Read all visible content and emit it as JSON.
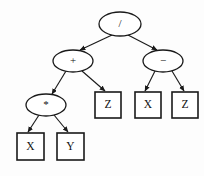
{
  "figure": {
    "background_color": "#fdfdfd",
    "line_color": "#1a1a1a",
    "node_fill": "#ffffff"
  },
  "nodes": [
    {
      "id": "root",
      "label": "/",
      "shape": "ellipse",
      "kind": "operator",
      "cx": 120,
      "cy": 24,
      "rx": 21,
      "ry": 12
    },
    {
      "id": "plus",
      "label": "+",
      "shape": "ellipse",
      "kind": "operator",
      "cx": 73,
      "cy": 61,
      "rx": 20,
      "ry": 11
    },
    {
      "id": "minus",
      "label": "−",
      "shape": "ellipse",
      "kind": "operator",
      "cx": 163,
      "cy": 61,
      "rx": 20,
      "ry": 11
    },
    {
      "id": "times",
      "label": "*",
      "shape": "ellipse",
      "kind": "operator",
      "cx": 46,
      "cy": 105,
      "rx": 20,
      "ry": 11
    },
    {
      "id": "leafZ1",
      "label": "Z",
      "shape": "rect",
      "kind": "operand",
      "x": 95,
      "y": 92,
      "w": 26,
      "h": 26
    },
    {
      "id": "leafX2",
      "label": "X",
      "shape": "rect",
      "kind": "operand",
      "x": 135,
      "y": 92,
      "w": 26,
      "h": 26
    },
    {
      "id": "leafZ2",
      "label": "Z",
      "shape": "rect",
      "kind": "operand",
      "x": 172,
      "y": 92,
      "w": 26,
      "h": 26
    },
    {
      "id": "leafX1",
      "label": "X",
      "shape": "rect",
      "kind": "operand",
      "x": 17,
      "y": 133,
      "w": 27,
      "h": 27
    },
    {
      "id": "leafY1",
      "label": "Y",
      "shape": "rect",
      "kind": "operand",
      "x": 57,
      "y": 133,
      "w": 27,
      "h": 27
    }
  ],
  "edges": [
    {
      "from": "root",
      "to": "plus",
      "x1": 112,
      "y1": 35,
      "x2": 80,
      "y2": 50
    },
    {
      "from": "root",
      "to": "minus",
      "x1": 128,
      "y1": 35,
      "x2": 157,
      "y2": 50
    },
    {
      "from": "plus",
      "to": "times",
      "x1": 66,
      "y1": 71,
      "x2": 52,
      "y2": 94
    },
    {
      "from": "plus",
      "to": "leafZ1",
      "x1": 82,
      "y1": 71,
      "x2": 105,
      "y2": 91
    },
    {
      "from": "minus",
      "to": "leafX2",
      "x1": 155,
      "y1": 71,
      "x2": 145,
      "y2": 91
    },
    {
      "from": "minus",
      "to": "leafZ2",
      "x1": 172,
      "y1": 71,
      "x2": 184,
      "y2": 91
    },
    {
      "from": "times",
      "to": "leafX1",
      "x1": 39,
      "y1": 115,
      "x2": 28,
      "y2": 132
    },
    {
      "from": "times",
      "to": "leafY1",
      "x1": 54,
      "y1": 115,
      "x2": 68,
      "y2": 132
    }
  ],
  "expression": {
    "infix": "((X * Y) + Z) / (X − Z)"
  }
}
